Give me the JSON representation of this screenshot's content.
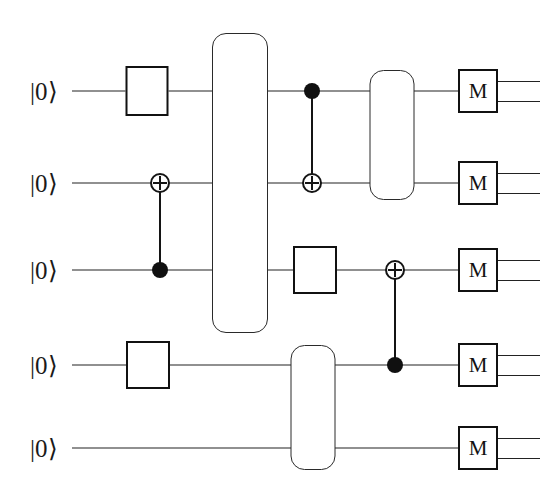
{
  "diagram": {
    "type": "quantum-circuit",
    "width": 547,
    "height": 490,
    "background_color": "#ffffff",
    "line_color": "#222222",
    "gate_fill": "#ffffff",
    "gate_border_color": "#111111",
    "num_qubits": 5,
    "qubits": [
      {
        "index": 0,
        "label": "|0⟩",
        "y": 91
      },
      {
        "index": 1,
        "label": "|0⟩",
        "y": 183
      },
      {
        "index": 2,
        "label": "|0⟩",
        "y": 270
      },
      {
        "index": 3,
        "label": "|0⟩",
        "y": 365
      },
      {
        "index": 4,
        "label": "|0⟩",
        "y": 448
      }
    ],
    "ket_x": 30,
    "wire_start_x": 72,
    "wire_end_x": 458,
    "single_gates": [
      {
        "name": "unlabeled-gate-q0",
        "label": "",
        "qubit": 0,
        "cx": 147,
        "cy": 91,
        "w": 43,
        "h": 50
      },
      {
        "name": "unlabeled-gate-q2",
        "label": "",
        "qubit": 2,
        "cx": 315,
        "cy": 270,
        "w": 44,
        "h": 48
      },
      {
        "name": "unlabeled-gate-q3",
        "label": "",
        "qubit": 3,
        "cx": 148,
        "cy": 365,
        "w": 44,
        "h": 48
      }
    ],
    "multi_gates": [
      {
        "name": "multi-qubit-gate-q0-q2",
        "label": "",
        "qubits": [
          0,
          1,
          2
        ],
        "cx": 240,
        "top": 33,
        "bottom": 333,
        "w": 56
      },
      {
        "name": "multi-qubit-gate-q0-q1",
        "label": "",
        "qubits": [
          0,
          1
        ],
        "cx": 392,
        "top": 70,
        "bottom": 200,
        "w": 45
      },
      {
        "name": "multi-qubit-gate-q3-q4",
        "label": "",
        "qubits": [
          3,
          4
        ],
        "cx": 313,
        "top": 345,
        "bottom": 470,
        "w": 45
      }
    ],
    "cnots": [
      {
        "name": "cnot-control-q2-target-q1",
        "x": 160,
        "control_qubit": 2,
        "control_y": 270,
        "target_qubit": 1,
        "target_y": 183
      },
      {
        "name": "cnot-control-q0-target-q1",
        "x": 312,
        "control_qubit": 0,
        "control_y": 91,
        "target_qubit": 1,
        "target_y": 183
      },
      {
        "name": "cnot-control-q3-target-q2",
        "x": 395,
        "control_qubit": 3,
        "control_y": 365,
        "target_qubit": 2,
        "target_y": 270
      }
    ],
    "control_dot_radius": 8,
    "target_radius": 10,
    "measurements": [
      {
        "name": "measurement-q0",
        "label": "M",
        "qubit": 0,
        "cx": 478,
        "cy": 91,
        "w": 40,
        "h": 44
      },
      {
        "name": "measurement-q1",
        "label": "M",
        "qubit": 1,
        "cx": 478,
        "cy": 183,
        "w": 40,
        "h": 44
      },
      {
        "name": "measurement-q2",
        "label": "M",
        "qubit": 2,
        "cx": 478,
        "cy": 270,
        "w": 40,
        "h": 44
      },
      {
        "name": "measurement-q3",
        "label": "M",
        "qubit": 3,
        "cx": 478,
        "cy": 365,
        "w": 40,
        "h": 44
      },
      {
        "name": "measurement-q4",
        "label": "M",
        "qubit": 4,
        "cx": 478,
        "cy": 448,
        "w": 40,
        "h": 44
      }
    ],
    "classical_out": {
      "start_x": 498,
      "end_x": 540,
      "offset": 10
    }
  }
}
